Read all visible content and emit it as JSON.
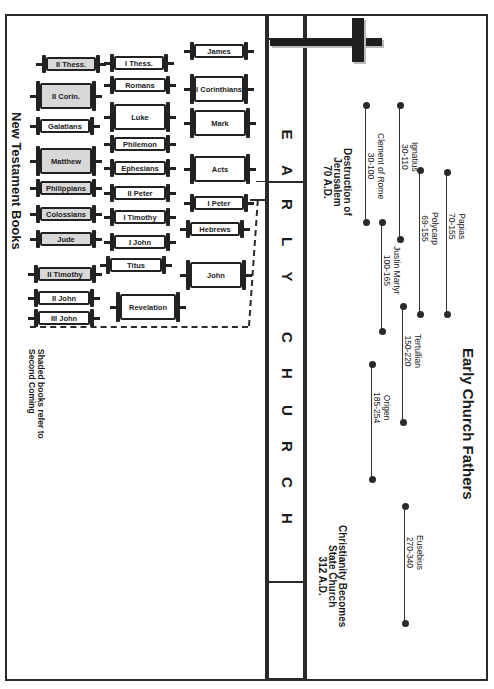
{
  "band": {
    "letters": [
      "E",
      "A",
      "R",
      "L",
      "Y",
      "C",
      "H",
      "U",
      "R",
      "C",
      "H"
    ]
  },
  "left_panel": {
    "title": "New Testament Books",
    "note_line1": "Shaded books refer to",
    "note_line2": "Second Coming",
    "books": [
      {
        "name": "II Thess.",
        "shaded": true
      },
      {
        "name": "I Thess.",
        "shaded": false
      },
      {
        "name": "James",
        "shaded": false
      },
      {
        "name": "II Corin.",
        "shaded": true
      },
      {
        "name": "Romans",
        "shaded": false
      },
      {
        "name": "I Corinthians",
        "shaded": false
      },
      {
        "name": "Galatians",
        "shaded": false
      },
      {
        "name": "Luke",
        "shaded": false
      },
      {
        "name": "Mark",
        "shaded": false
      },
      {
        "name": "Matthew",
        "shaded": true
      },
      {
        "name": "Philemon",
        "shaded": false
      },
      {
        "name": "Ephesians",
        "shaded": false
      },
      {
        "name": "Acts",
        "shaded": false
      },
      {
        "name": "Philippians",
        "shaded": true
      },
      {
        "name": "II Peter",
        "shaded": false
      },
      {
        "name": "I Peter",
        "shaded": false
      },
      {
        "name": "Colossians",
        "shaded": true
      },
      {
        "name": "I Timothy",
        "shaded": false
      },
      {
        "name": "Hebrews",
        "shaded": false
      },
      {
        "name": "Jude",
        "shaded": true
      },
      {
        "name": "I John",
        "shaded": false
      },
      {
        "name": "II Timothy",
        "shaded": true
      },
      {
        "name": "Titus",
        "shaded": false
      },
      {
        "name": "John",
        "shaded": false
      },
      {
        "name": "II John",
        "shaded": false
      },
      {
        "name": "III John",
        "shaded": false
      },
      {
        "name": "Revelation",
        "shaded": false
      }
    ]
  },
  "right_panel": {
    "title": "Early Church Fathers",
    "events": [
      {
        "line1": "Destruction of",
        "line2": "Jerusalem",
        "line3": "70 A.D."
      },
      {
        "line1": "Christianity Becomes",
        "line2": "State Church",
        "line3": "312 A.D."
      }
    ],
    "fathers": [
      {
        "name": "Clement of Rome",
        "dates": "30-100",
        "start": 30,
        "end": 100
      },
      {
        "name": "Ignatius",
        "dates": "30-110",
        "start": 30,
        "end": 110
      },
      {
        "name": "Papias",
        "dates": "70-155",
        "start": 70,
        "end": 155
      },
      {
        "name": "Polycarp",
        "dates": "69-155",
        "start": 69,
        "end": 155
      },
      {
        "name": "Justin Martyr",
        "dates": "100-165",
        "start": 100,
        "end": 165
      },
      {
        "name": "Tertullian",
        "dates": "150-220",
        "start": 150,
        "end": 220
      },
      {
        "name": "Origen",
        "dates": "185-254",
        "start": 185,
        "end": 254
      },
      {
        "name": "Eusebius",
        "dates": "270-340",
        "start": 270,
        "end": 340
      }
    ]
  },
  "icons": {
    "cross": "cross-icon"
  }
}
